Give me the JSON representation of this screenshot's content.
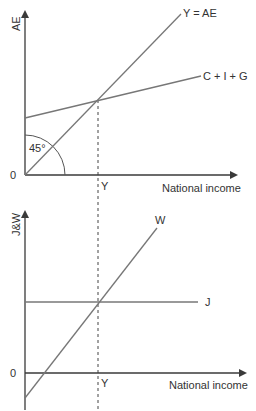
{
  "colors": {
    "axis": "#3a3a3a",
    "line": "#777777",
    "text": "#333333",
    "dashed": "#444444"
  },
  "top_panel": {
    "y_axis_label": "AE",
    "x_axis_label": "National income",
    "origin_label": "0",
    "equilibrium_label": "Y",
    "angle_label": "45°",
    "lines": [
      {
        "name": "Y = AE",
        "label": "Y = AE"
      },
      {
        "name": "C + I + G",
        "label": "C + I + G"
      }
    ]
  },
  "bottom_panel": {
    "y_axis_label": "J&W",
    "x_axis_label": "National income",
    "origin_label": "0",
    "equilibrium_label": "Y",
    "lines": [
      {
        "name": "W",
        "label": "W"
      },
      {
        "name": "J",
        "label": "J"
      }
    ]
  }
}
